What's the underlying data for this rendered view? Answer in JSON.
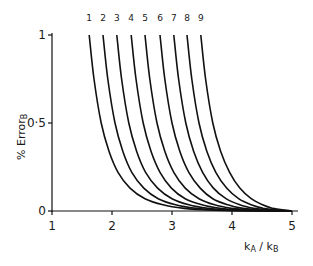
{
  "chart_data": {
    "type": "line",
    "title": "",
    "xlabel": "kA / kB",
    "xlabel_main": "k",
    "xlabel_sub_a": "A",
    "xlabel_sep": " / ",
    "xlabel_main2": "k",
    "xlabel_sub_b": "B",
    "ylabel": "% Error B",
    "ylabel_main": "% Error",
    "ylabel_sub": "B",
    "xlim": [
      1,
      5
    ],
    "ylim": [
      0,
      1
    ],
    "xticks": [
      "1",
      "2",
      "3",
      "4",
      "5"
    ],
    "yticks": [
      "0",
      "0·5",
      "1"
    ],
    "grid": false,
    "legend_position": "top labels above each curve",
    "series": [
      {
        "name": "1",
        "x": [
          1.62,
          1.7,
          1.82,
          1.95,
          2.1,
          2.3,
          2.55,
          2.85,
          3.2,
          3.6,
          4.1,
          4.7
        ],
        "y": [
          1.0,
          0.75,
          0.5,
          0.34,
          0.22,
          0.13,
          0.07,
          0.035,
          0.015,
          0.006,
          0.002,
          0.0
        ]
      },
      {
        "name": "2",
        "x": [
          1.85,
          1.93,
          2.05,
          2.18,
          2.33,
          2.53,
          2.77,
          3.06,
          3.4,
          3.78,
          4.25,
          4.78
        ],
        "y": [
          1.0,
          0.75,
          0.5,
          0.34,
          0.22,
          0.13,
          0.07,
          0.035,
          0.015,
          0.006,
          0.002,
          0.0
        ]
      },
      {
        "name": "3",
        "x": [
          2.08,
          2.16,
          2.28,
          2.41,
          2.56,
          2.76,
          3.0,
          3.28,
          3.6,
          3.95,
          4.38,
          4.85
        ],
        "y": [
          1.0,
          0.75,
          0.5,
          0.34,
          0.22,
          0.13,
          0.07,
          0.035,
          0.015,
          0.006,
          0.002,
          0.0
        ]
      },
      {
        "name": "4",
        "x": [
          2.32,
          2.4,
          2.52,
          2.65,
          2.8,
          2.99,
          3.22,
          3.5,
          3.8,
          4.12,
          4.5,
          4.9
        ],
        "y": [
          1.0,
          0.75,
          0.5,
          0.34,
          0.22,
          0.13,
          0.07,
          0.035,
          0.015,
          0.006,
          0.002,
          0.0
        ]
      },
      {
        "name": "5",
        "x": [
          2.55,
          2.63,
          2.75,
          2.88,
          3.03,
          3.22,
          3.45,
          3.71,
          3.99,
          4.28,
          4.61,
          4.94
        ],
        "y": [
          1.0,
          0.75,
          0.5,
          0.34,
          0.22,
          0.13,
          0.07,
          0.035,
          0.015,
          0.006,
          0.002,
          0.0
        ]
      },
      {
        "name": "6",
        "x": [
          2.8,
          2.88,
          3.0,
          3.13,
          3.28,
          3.47,
          3.68,
          3.93,
          4.18,
          4.44,
          4.72,
          4.97
        ],
        "y": [
          1.0,
          0.75,
          0.5,
          0.34,
          0.22,
          0.13,
          0.07,
          0.035,
          0.015,
          0.006,
          0.002,
          0.0
        ]
      },
      {
        "name": "7",
        "x": [
          3.03,
          3.11,
          3.23,
          3.36,
          3.51,
          3.69,
          3.9,
          4.13,
          4.36,
          4.58,
          4.81,
          4.99
        ],
        "y": [
          1.0,
          0.75,
          0.5,
          0.34,
          0.22,
          0.13,
          0.07,
          0.035,
          0.015,
          0.006,
          0.002,
          0.0
        ]
      },
      {
        "name": "8",
        "x": [
          3.25,
          3.33,
          3.45,
          3.58,
          3.73,
          3.91,
          4.11,
          4.32,
          4.52,
          4.72,
          4.89,
          5.0
        ],
        "y": [
          1.0,
          0.75,
          0.5,
          0.34,
          0.22,
          0.13,
          0.07,
          0.035,
          0.015,
          0.006,
          0.002,
          0.0
        ]
      },
      {
        "name": "9",
        "x": [
          3.48,
          3.56,
          3.68,
          3.81,
          3.96,
          4.13,
          4.32,
          4.51,
          4.68,
          4.84,
          4.95,
          5.0
        ],
        "y": [
          1.0,
          0.75,
          0.5,
          0.34,
          0.22,
          0.13,
          0.07,
          0.035,
          0.015,
          0.006,
          0.002,
          0.0
        ]
      }
    ]
  }
}
